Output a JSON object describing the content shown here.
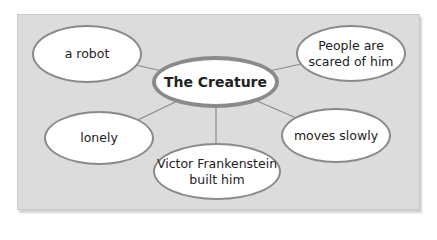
{
  "diagram": {
    "type": "mind-map",
    "center": {
      "label": "The Creature"
    },
    "branches": [
      {
        "id": "top-left",
        "lines": [
          "a robot"
        ]
      },
      {
        "id": "top-right",
        "lines": [
          "People are",
          "scared of him"
        ]
      },
      {
        "id": "mid-left",
        "lines": [
          "lonely"
        ]
      },
      {
        "id": "mid-right",
        "lines": [
          "moves slowly"
        ]
      },
      {
        "id": "bottom",
        "lines": [
          "Victor Frankenstein",
          "built him"
        ]
      }
    ],
    "colors": {
      "panel_background": "#dcdcdc",
      "node_fill": "#ffffff",
      "node_border": "#8a8a8a",
      "connector": "#8a8a8a",
      "text": "#222222"
    }
  }
}
